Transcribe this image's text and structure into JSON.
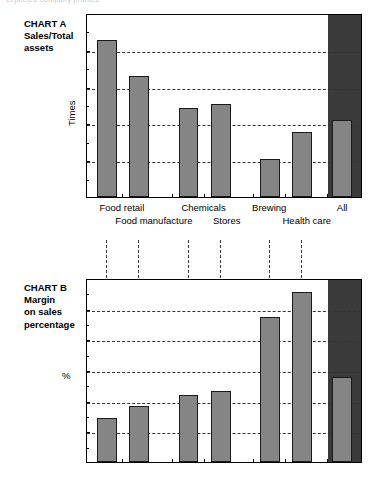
{
  "top_fragment": "expected company profiles",
  "charts": [
    {
      "id": "chart-a",
      "caption": "CHART A\nSales/Total\nassets",
      "axis_label": "Times",
      "yticks": [
        "0",
        "0.5",
        "1",
        "1.5",
        "2",
        "2.5"
      ],
      "category_labels_row1": [
        "Food retail",
        "Chemicals",
        "Brewing",
        "All"
      ],
      "category_labels_row2": [
        "Food manufacture",
        "Stores",
        "Health care"
      ],
      "chart_data": {
        "type": "bar",
        "title": "CHART A Sales/Total assets",
        "xlabel": "",
        "ylabel": "Times",
        "ylim": [
          0,
          2.5
        ],
        "ytick_values": [
          0,
          0.5,
          1,
          1.5,
          2,
          2.5
        ],
        "grid": "horizontal-dashed",
        "legend": "none",
        "highlight_category": "All",
        "categories": [
          "Food retail",
          "Food manufacture",
          "Chemicals",
          "Stores",
          "Brewing",
          "Health care",
          "All"
        ],
        "values": [
          2.13,
          1.64,
          1.21,
          1.26,
          0.52,
          0.89,
          1.04
        ]
      }
    },
    {
      "id": "chart-b",
      "caption": "CHART B\nMargin\non sales\npercentage",
      "axis_label": "%",
      "yticks": [
        "0",
        "5",
        "10",
        "15",
        "20",
        "25",
        "30"
      ],
      "category_labels_row1": [],
      "category_labels_row2": [],
      "chart_data": {
        "type": "bar",
        "title": "CHART B Margin on sales percentage",
        "xlabel": "",
        "ylabel": "%",
        "ylim": [
          0,
          30
        ],
        "ytick_values": [
          0,
          5,
          10,
          15,
          20,
          25,
          30
        ],
        "grid": "horizontal-dashed",
        "legend": "none",
        "highlight_category": "All",
        "categories": [
          "Food retail",
          "Food manufacture",
          "Chemicals",
          "Stores",
          "Brewing",
          "Health care",
          "All"
        ],
        "values": [
          7.2,
          9.2,
          11.0,
          11.6,
          23.6,
          27.7,
          13.8
        ]
      }
    }
  ],
  "colors": {
    "bar_fill": "#858585",
    "bar_stroke": "#1a1a1a",
    "highlight_panel": "#3a3a3a",
    "gridline": "#333333",
    "axis": "#000000",
    "background": "#ffffff"
  }
}
